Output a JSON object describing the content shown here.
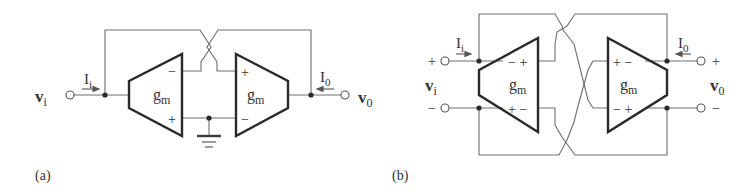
{
  "figure": {
    "panels": [
      {
        "id": "a",
        "caption": "(a)",
        "input_voltage": {
          "main": "v",
          "sub": "i"
        },
        "input_current": {
          "main": "I",
          "sub": "i"
        },
        "output_voltage": {
          "main": "v",
          "sub": "0"
        },
        "output_current": {
          "main": "I",
          "sub": "0"
        },
        "amp_left": {
          "label_main": "g",
          "label_sub": "m",
          "top_sign": "−",
          "bottom_sign": "+"
        },
        "amp_right": {
          "label_main": "g",
          "label_sub": "m",
          "top_sign": "+",
          "bottom_sign": "−"
        },
        "ground": "ground-symbol"
      },
      {
        "id": "b",
        "caption": "(b)",
        "input_voltage": {
          "main": "v",
          "sub": "i"
        },
        "input_current": {
          "main": "I",
          "sub": "i"
        },
        "output_voltage": {
          "main": "v",
          "sub": "0"
        },
        "output_current": {
          "main": "I",
          "sub": "0"
        },
        "input_plus": "+",
        "input_minus": "−",
        "output_plus": "+",
        "output_minus": "−",
        "amp_left": {
          "label_main": "g",
          "label_sub": "m",
          "top_signs": "− +",
          "bottom_signs": "+ −"
        },
        "amp_right": {
          "label_main": "g",
          "label_sub": "m",
          "top_signs": "+ −",
          "bottom_signs": "− +"
        }
      }
    ]
  }
}
